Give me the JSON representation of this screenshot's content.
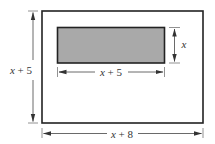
{
  "diagram": {
    "colors": {
      "stroke": "#222222",
      "inner_fill": "#a9a9a9",
      "dimension_line": "#444444",
      "background": "#ffffff"
    },
    "outer_rectangle": {
      "width_label": {
        "var": "x",
        "rest": " + 8"
      },
      "height_label": {
        "var": "x",
        "rest": " + 5"
      }
    },
    "inner_rectangle": {
      "width_label": {
        "var": "x",
        "rest": " + 5"
      },
      "height_label": {
        "var": "x",
        "rest": ""
      }
    }
  }
}
